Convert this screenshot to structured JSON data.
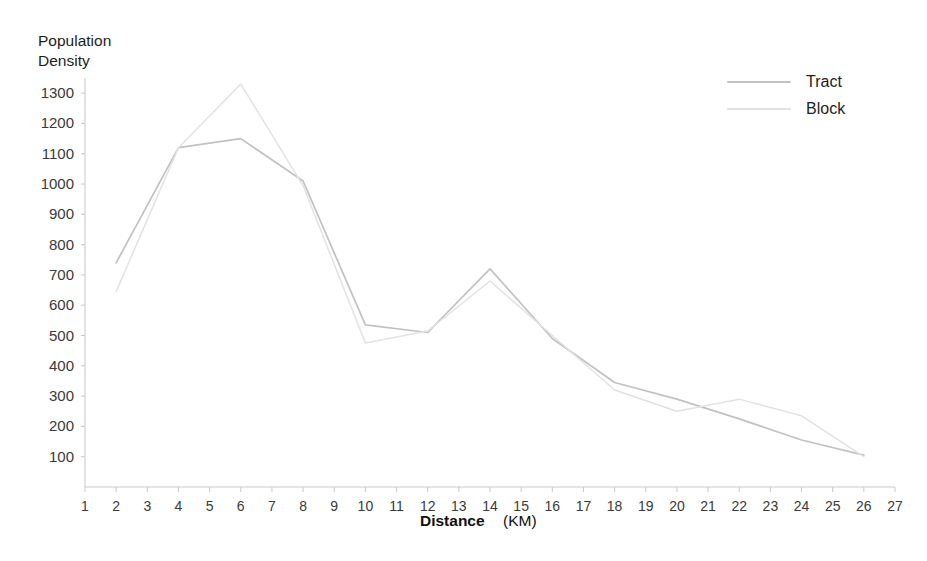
{
  "chart_data": {
    "type": "line",
    "title": "",
    "xlabel": "Distance",
    "xlabel_unit": "(KM)",
    "ylabel_line1": "Population",
    "ylabel_line2": "Density",
    "xlim": [
      1,
      27
    ],
    "ylim": [
      0,
      1350
    ],
    "xticks": [
      1,
      2,
      3,
      4,
      5,
      6,
      7,
      8,
      9,
      10,
      11,
      12,
      13,
      14,
      15,
      16,
      17,
      18,
      19,
      20,
      21,
      22,
      23,
      24,
      25,
      26,
      27
    ],
    "yticks": [
      100,
      200,
      300,
      400,
      500,
      600,
      700,
      800,
      900,
      1000,
      1100,
      1200,
      1300
    ],
    "grid": false,
    "legend_position": "top-right",
    "x": [
      2,
      4,
      6,
      8,
      10,
      12,
      14,
      16,
      18,
      20,
      22,
      24,
      26
    ],
    "series": [
      {
        "name": "Tract",
        "color": "#c2c2c2",
        "values": [
          740,
          1120,
          1150,
          1010,
          535,
          510,
          720,
          490,
          345,
          290,
          225,
          155,
          105
        ]
      },
      {
        "name": "Block",
        "color": "#e2e2e2",
        "values": [
          645,
          1120,
          1330,
          995,
          475,
          515,
          680,
          500,
          320,
          250,
          290,
          235,
          100
        ]
      }
    ]
  },
  "legend": {
    "items": [
      {
        "label": "Tract"
      },
      {
        "label": "Block"
      }
    ]
  },
  "axes": {
    "y_title_line1": "Population",
    "y_title_line2": "Density",
    "x_title": "Distance",
    "x_title_unit": "(KM)"
  }
}
